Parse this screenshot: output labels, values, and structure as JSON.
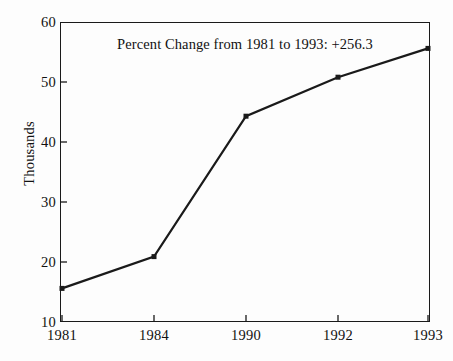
{
  "chart_data": {
    "type": "line",
    "title": "",
    "annotation": "Percent Change from 1981 to 1993:  +256.3",
    "categories": [
      "1981",
      "1984",
      "1990",
      "1992",
      "1993"
    ],
    "values": [
      15.6,
      20.9,
      44.3,
      50.8,
      55.6
    ],
    "series": [
      {
        "name": "",
        "values": [
          15.6,
          20.9,
          44.3,
          50.8,
          55.6
        ]
      }
    ],
    "xlabel": "",
    "ylabel": "Thousands",
    "ylim": [
      10,
      60
    ],
    "yticks": [
      10,
      20,
      30,
      40,
      50,
      60
    ],
    "ytick_labels": [
      "10",
      "20",
      "30",
      "40",
      "50",
      "60"
    ],
    "xtick_labels": [
      "1981",
      "1984",
      "1990",
      "1992",
      "1993"
    ],
    "grid": false,
    "legend": false,
    "marker": "square",
    "line_color": "#1a1a1a",
    "marker_color": "#1a1a1a",
    "axis_color": "#1a1a1a",
    "background_color": "#fdfdfd"
  }
}
